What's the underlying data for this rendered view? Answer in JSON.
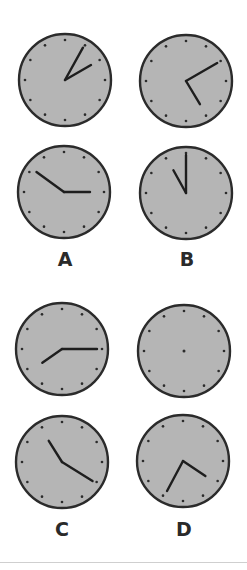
{
  "colors": {
    "face": "#b5b5b5",
    "rim": "#2b2b2b",
    "hand": "#1e1e1e",
    "tick": "#2b2b2b",
    "divider": "#cfcfcf"
  },
  "groups": [
    {
      "label": "A",
      "label_pos": {
        "x": 65,
        "y": 250
      },
      "clocks": [
        {
          "cx": 65,
          "cy": 80,
          "r": 46,
          "hands": [
            {
              "angle": 29,
              "length": 37
            },
            {
              "angle": 60,
              "length": 30
            }
          ],
          "center_dot": false
        },
        {
          "cx": 64,
          "cy": 192,
          "r": 46,
          "hands": [
            {
              "angle": 306,
              "length": 34
            },
            {
              "angle": 90,
              "length": 26
            }
          ],
          "center_dot": false
        }
      ]
    },
    {
      "label": "B",
      "label_pos": {
        "x": 187,
        "y": 250
      },
      "clocks": [
        {
          "cx": 186,
          "cy": 81,
          "r": 46,
          "hands": [
            {
              "angle": 60,
              "length": 36
            },
            {
              "angle": 149,
              "length": 27
            }
          ],
          "center_dot": false
        },
        {
          "cx": 186,
          "cy": 193,
          "r": 46,
          "hands": [
            {
              "angle": 0,
              "length": 38
            },
            {
              "angle": 331,
              "length": 26
            }
          ],
          "center_dot": false
        }
      ]
    },
    {
      "label": "C",
      "label_pos": {
        "x": 62,
        "y": 520
      },
      "clocks": [
        {
          "cx": 62,
          "cy": 349,
          "r": 46,
          "hands": [
            {
              "angle": 90,
              "length": 35
            },
            {
              "angle": 235,
              "length": 24
            }
          ],
          "center_dot": false
        },
        {
          "cx": 62,
          "cy": 462,
          "r": 46,
          "hands": [
            {
              "angle": 328,
              "length": 25
            },
            {
              "angle": 122,
              "length": 36
            }
          ],
          "center_dot": false
        }
      ]
    },
    {
      "label": "D",
      "label_pos": {
        "x": 184,
        "y": 520
      },
      "clocks": [
        {
          "cx": 184,
          "cy": 351,
          "r": 46,
          "hands": [],
          "center_dot": true
        },
        {
          "cx": 183,
          "cy": 461,
          "r": 46,
          "hands": [
            {
              "angle": 124,
              "length": 27
            },
            {
              "angle": 208,
              "length": 34
            }
          ],
          "center_dot": false
        }
      ]
    }
  ]
}
